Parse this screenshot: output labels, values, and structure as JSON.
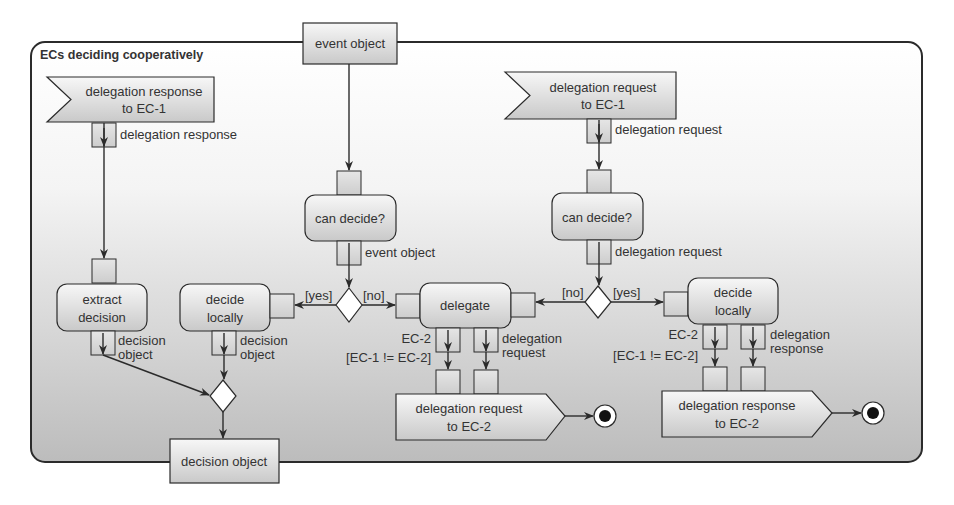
{
  "diagram": {
    "type": "UML activity diagram",
    "frame": {
      "title": "ECs deciding cooperatively"
    },
    "colors": {
      "frame_top": "#ffffff",
      "frame_bottom": "#bdbdbd",
      "node_fill_top": "#f2f2f2",
      "node_fill_bottom": "#c8c8c8",
      "stroke": "#2b2b2b",
      "text": "#333333"
    },
    "nodes": {
      "accept_response": {
        "line1": "delegation response",
        "line2": "to EC-1"
      },
      "accept_request": {
        "line1": "delegation request",
        "line2": "to EC-1"
      },
      "event_object": {
        "label": "event object"
      },
      "can_decide_left": {
        "label": "can decide?"
      },
      "can_decide_right": {
        "label": "can decide?"
      },
      "extract_decision": {
        "line1": "extract",
        "line2": "decision"
      },
      "decide_locally_left": {
        "line1": "decide",
        "line2": "locally"
      },
      "delegate": {
        "label": "delegate"
      },
      "decide_locally_right": {
        "line1": "decide",
        "line2": "locally"
      },
      "send_request": {
        "line1": "delegation request",
        "line2": "to EC-2"
      },
      "send_response": {
        "line1": "delegation response",
        "line2": "to EC-2"
      },
      "decision_object": {
        "label": "decision object"
      }
    },
    "pin_labels": {
      "delegation_response_out": "delegation response",
      "delegation_request_out": "delegation request",
      "event_object_out": "event object",
      "delegation_request_out2": "delegation request",
      "extract_decision_out_1": "decision",
      "extract_decision_out_2": "object",
      "decide_left_out_1": "decision",
      "decide_left_out_2": "object",
      "delegate_ec2": "EC-2",
      "delegate_req_1": "delegation",
      "delegate_req_2": "request",
      "decide_right_ec2": "EC-2",
      "decide_right_resp_1": "delegation",
      "decide_right_resp_2": "response"
    },
    "guards": {
      "left_yes": "[yes]",
      "left_no": "[no]",
      "right_no": "[no]",
      "right_yes": "[yes]",
      "delegate_guard": "[EC-1 != EC-2]",
      "decide_guard": "[EC-1 != EC-2]"
    }
  }
}
